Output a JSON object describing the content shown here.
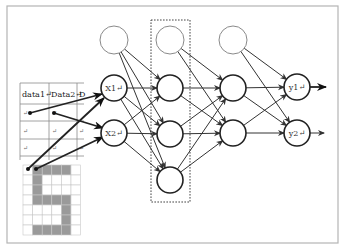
{
  "diagram": {
    "type": "neural-network",
    "colors": {
      "frame": "#b4b4b4",
      "node_stroke": "#222222",
      "bias_stroke": "#8a8a8a",
      "grid_filled": "#9a9a9a",
      "edge": "#333333"
    },
    "table": {
      "headers": [
        "data1↵",
        "Data2↵",
        "D"
      ],
      "row_mark": "↵",
      "rows": 3
    },
    "pixel_grid": {
      "cols": 6,
      "rows": 7,
      "pattern": [
        [
          0,
          1,
          1,
          1,
          1,
          0
        ],
        [
          0,
          1,
          0,
          0,
          0,
          0
        ],
        [
          0,
          1,
          0,
          0,
          0,
          0
        ],
        [
          0,
          1,
          1,
          1,
          1,
          0
        ],
        [
          0,
          0,
          0,
          0,
          1,
          0
        ],
        [
          0,
          0,
          0,
          0,
          1,
          0
        ],
        [
          0,
          1,
          1,
          1,
          1,
          0
        ]
      ]
    },
    "layers": {
      "input": [
        {
          "label": "X1↵"
        },
        {
          "label": "X2↵"
        }
      ],
      "hidden1": [
        {
          "label": ""
        },
        {
          "label": ""
        },
        {
          "label": ""
        }
      ],
      "hidden2": [
        {
          "label": ""
        },
        {
          "label": ""
        }
      ],
      "output": [
        {
          "label": "y1↵"
        },
        {
          "label": "y2↵"
        }
      ]
    },
    "bias_nodes": 3,
    "highlight_box": "hidden-layer-1"
  }
}
